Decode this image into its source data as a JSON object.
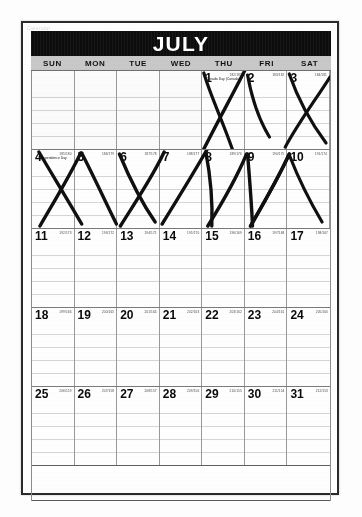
{
  "document": {
    "type": "scanned-calendar-page",
    "month_title": "JULY",
    "faint_margin_note": "Calendar"
  },
  "colors": {
    "banner_bg": "#0d0d0d",
    "banner_text": "#ffffff",
    "weekday_bg": "#c9c9c9",
    "page_border": "#2b2b2b",
    "grid_line": "#9a9a9a",
    "ink": "#101010"
  },
  "weekdays": [
    "SUN",
    "MON",
    "TUE",
    "WED",
    "THU",
    "FRI",
    "SAT"
  ],
  "weeks": [
    {
      "days": [
        {
          "num": "",
          "julian": "",
          "holiday": "",
          "empty": true
        },
        {
          "num": "",
          "julian": "",
          "holiday": "",
          "empty": true
        },
        {
          "num": "",
          "julian": "",
          "holiday": "",
          "empty": true
        },
        {
          "num": "",
          "julian": "",
          "holiday": "",
          "empty": true
        },
        {
          "num": "1",
          "julian": "182/183",
          "holiday": "Canada Day (Canada)",
          "empty": false
        },
        {
          "num": "2",
          "julian": "183/182",
          "holiday": "",
          "empty": false
        },
        {
          "num": "3",
          "julian": "184/181",
          "holiday": "",
          "empty": false
        }
      ]
    },
    {
      "days": [
        {
          "num": "4",
          "julian": "185/180",
          "holiday": "Independence Day",
          "empty": false
        },
        {
          "num": "5",
          "julian": "186/179",
          "holiday": "",
          "empty": false
        },
        {
          "num": "6",
          "julian": "187/178",
          "holiday": "",
          "empty": false
        },
        {
          "num": "7",
          "julian": "188/177",
          "holiday": "",
          "empty": false
        },
        {
          "num": "8",
          "julian": "189/176",
          "holiday": "",
          "empty": false
        },
        {
          "num": "9",
          "julian": "190/175",
          "holiday": "",
          "empty": false
        },
        {
          "num": "10",
          "julian": "191/174",
          "holiday": "",
          "empty": false
        }
      ]
    },
    {
      "days": [
        {
          "num": "11",
          "julian": "192/173",
          "holiday": "",
          "empty": false
        },
        {
          "num": "12",
          "julian": "193/172",
          "holiday": "",
          "empty": false
        },
        {
          "num": "13",
          "julian": "194/171",
          "holiday": "",
          "empty": false
        },
        {
          "num": "14",
          "julian": "195/170",
          "holiday": "",
          "empty": false
        },
        {
          "num": "15",
          "julian": "196/169",
          "holiday": "",
          "empty": false
        },
        {
          "num": "16",
          "julian": "197/168",
          "holiday": "",
          "empty": false
        },
        {
          "num": "17",
          "julian": "198/167",
          "holiday": "",
          "empty": false
        }
      ]
    },
    {
      "days": [
        {
          "num": "18",
          "julian": "199/166",
          "holiday": "",
          "empty": false
        },
        {
          "num": "19",
          "julian": "200/165",
          "holiday": "",
          "empty": false
        },
        {
          "num": "20",
          "julian": "201/164",
          "holiday": "",
          "empty": false
        },
        {
          "num": "21",
          "julian": "202/163",
          "holiday": "",
          "empty": false
        },
        {
          "num": "22",
          "julian": "203/162",
          "holiday": "",
          "empty": false
        },
        {
          "num": "23",
          "julian": "204/161",
          "holiday": "",
          "empty": false
        },
        {
          "num": "24",
          "julian": "205/160",
          "holiday": "",
          "empty": false
        }
      ]
    },
    {
      "days": [
        {
          "num": "25",
          "julian": "206/159",
          "holiday": "",
          "empty": false
        },
        {
          "num": "26",
          "julian": "207/158",
          "holiday": "",
          "empty": false
        },
        {
          "num": "27",
          "julian": "208/157",
          "holiday": "",
          "empty": false
        },
        {
          "num": "28",
          "julian": "209/156",
          "holiday": "",
          "empty": false
        },
        {
          "num": "29",
          "julian": "210/155",
          "holiday": "",
          "empty": false
        },
        {
          "num": "30",
          "julian": "211/154",
          "holiday": "",
          "empty": false
        },
        {
          "num": "31",
          "julian": "212/153",
          "holiday": "",
          "empty": false
        }
      ]
    }
  ],
  "annotations": {
    "description": "hand-drawn ink X marks crossing out elapsed days",
    "crossed_out_days": [
      "1",
      "2",
      "3",
      "4",
      "5",
      "6",
      "7",
      "8",
      "9",
      "10"
    ]
  }
}
